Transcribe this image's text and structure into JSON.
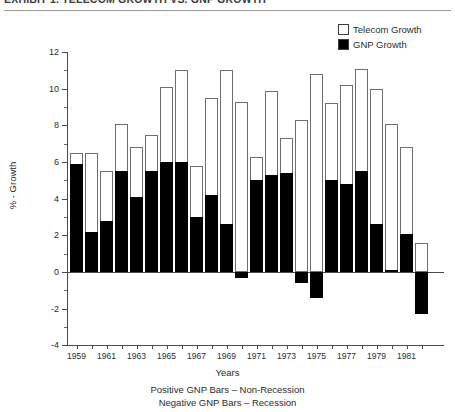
{
  "title": "EXHIBIT 1.  TELECOM GROWTH VS. GNP GROWTH",
  "legend": {
    "items": [
      {
        "label": "Telecom Growth",
        "swatch": "white-square-icon",
        "color": "#ffffff"
      },
      {
        "label": "GNP Growth",
        "swatch": "black-square-icon",
        "color": "#000000"
      }
    ]
  },
  "axis": {
    "ylabel": "% - Growth",
    "xlabel": "Years",
    "yticks": [
      "12",
      "10",
      "8",
      "6",
      "4",
      "2",
      "0",
      "-2",
      "-4"
    ],
    "xticks": [
      "1959",
      "1961",
      "1963",
      "1965",
      "1967",
      "1969",
      "1971",
      "1973",
      "1975",
      "1977",
      "1979",
      "1981"
    ]
  },
  "footnotes": [
    "Positive GNP Bars – Non-Recession",
    "Negative GNP Bars – Recession"
  ],
  "chart_data": {
    "type": "bar",
    "title": "EXHIBIT 1.  TELECOM GROWTH VS. GNP GROWTH",
    "xlabel": "Years",
    "ylabel": "% - Growth",
    "ylim": [
      -4,
      12
    ],
    "ytick_step": 2,
    "grid": false,
    "legend_position": "top-right",
    "stacked": true,
    "categories": [
      "1959",
      "1960",
      "1961",
      "1962",
      "1963",
      "1964",
      "1965",
      "1966",
      "1967",
      "1968",
      "1969",
      "1970",
      "1971",
      "1972",
      "1973",
      "1974",
      "1975",
      "1976",
      "1977",
      "1978",
      "1979",
      "1980",
      "1981",
      "1982"
    ],
    "series": [
      {
        "name": "GNP Growth",
        "color": "#000000",
        "values": [
          5.9,
          2.2,
          2.8,
          5.5,
          4.1,
          5.5,
          6.0,
          6.0,
          3.0,
          4.2,
          2.6,
          -0.3,
          5.0,
          5.3,
          5.4,
          -0.6,
          -1.4,
          5.0,
          4.8,
          5.5,
          2.6,
          0.1,
          2.1,
          -2.3
        ],
        "ylabel": "GNP Growth (%)"
      },
      {
        "name": "Telecom Growth",
        "color": "#ffffff",
        "values": [
          6.5,
          6.5,
          5.5,
          8.1,
          6.8,
          7.5,
          10.1,
          11.0,
          5.8,
          9.5,
          11.0,
          9.3,
          6.3,
          9.9,
          7.3,
          8.3,
          10.8,
          9.2,
          10.2,
          11.1,
          10.0,
          8.1,
          6.8,
          1.6
        ],
        "note": "Telecom Growth values are the total (top) of each stacked bar",
        "ylabel": "Telecom Growth (%)"
      }
    ]
  }
}
